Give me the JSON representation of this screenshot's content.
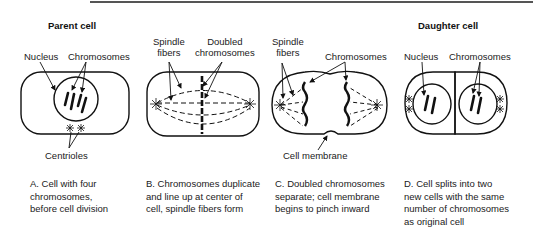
{
  "stages": [
    {
      "id": "A",
      "title": "Parent cell",
      "labels": {
        "nucleus": "Nucleus",
        "chromosomes": "Chromosomes",
        "centrioles": "Centrioles"
      },
      "caption": "A. Cell with four\nchromosomes,\nbefore cell division"
    },
    {
      "id": "B",
      "labels": {
        "spindle_fibers": "Spindle\nfibers",
        "doubled_chromosomes": "Doubled\nchromosomes"
      },
      "caption": "B. Chromosomes duplicate\nand line up at center of\ncell, spindle fibers form"
    },
    {
      "id": "C",
      "labels": {
        "spindle_fibers": "Spindle\nfibers",
        "chromosomes": "Chromosomes",
        "cell_membrane": "Cell membrane"
      },
      "caption": "C. Doubled chromosomes\nseparate; cell membrane\nbegins to pinch inward"
    },
    {
      "id": "D",
      "title": "Daughter cell",
      "labels": {
        "nucleus": "Nucleus",
        "chromosomes": "Chromosomes"
      },
      "caption": "D. Cell splits into two\nnew cells with the same\nnumber of chromosomes\nas original cell"
    }
  ]
}
